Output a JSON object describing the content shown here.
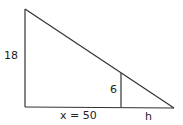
{
  "diagram": {
    "type": "similar-triangles",
    "labels": {
      "big_height": "18",
      "small_height": "6",
      "base": "x = 50",
      "shadow": "h"
    },
    "stroke_color": "#333333"
  }
}
